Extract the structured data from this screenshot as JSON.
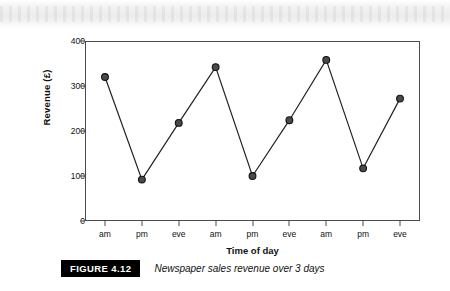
{
  "figure": {
    "badge": "FIGURE 4.12",
    "caption": "Newspaper sales revenue over 3 days"
  },
  "chart_data": {
    "type": "line",
    "title": "",
    "xlabel": "Time of day",
    "ylabel": "Revenue (£)",
    "categories": [
      "am",
      "pm",
      "eve",
      "am",
      "pm",
      "eve",
      "am",
      "pm",
      "eve"
    ],
    "values": [
      320,
      92,
      218,
      342,
      100,
      224,
      358,
      117,
      272
    ],
    "ylim": [
      0,
      400
    ],
    "yticks": [
      0,
      100,
      200,
      300,
      400
    ],
    "ytick_labels": [
      "0",
      "100",
      "200",
      "300",
      "400"
    ],
    "grid": false,
    "legend": false,
    "marker": "circle",
    "marker_fill": "#4a4a4a",
    "marker_edge": "#111111",
    "line_color": "#222222"
  }
}
